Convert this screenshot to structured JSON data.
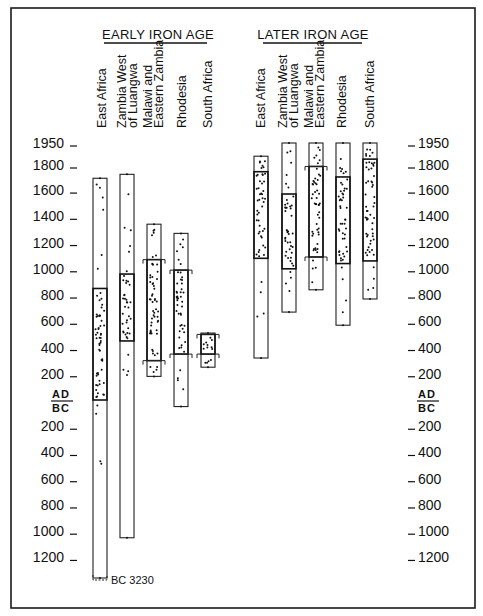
{
  "chart_data": {
    "type": "range-dot",
    "title": "",
    "groups": [
      {
        "title": "EARLY IRON AGE",
        "regions": [
          {
            "label": [
              "East Africa"
            ],
            "range": [
              -3230,
              1690
            ],
            "main_range": [
              0,
              850
            ],
            "bracketed": false,
            "note": "BC 3230"
          },
          {
            "label": [
              "Zambia West",
              "of Luangwa"
            ],
            "range": [
              -1050,
              1720
            ],
            "main_range": [
              450,
              960
            ],
            "bracketed": false
          },
          {
            "label": [
              "Malawi and",
              "Eastern Zambia"
            ],
            "range": [
              180,
              1340
            ],
            "main_range": [
              300,
              1070
            ],
            "bracketed": true
          },
          {
            "label": [
              "Rhodesia"
            ],
            "range": [
              -50,
              1270
            ],
            "main_range": [
              350,
              990
            ],
            "bracketed": true
          },
          {
            "label": [
              "South Africa"
            ],
            "range": [
              250,
              510
            ],
            "main_range": [
              350,
              500
            ],
            "bracketed": true
          }
        ]
      },
      {
        "title": "LATER IRON AGE",
        "regions": [
          {
            "label": [
              "East Africa"
            ],
            "range": [
              320,
              1860
            ],
            "main_range": [
              1080,
              1740
            ],
            "bracketed": false
          },
          {
            "label": [
              "Zambia West",
              "of Luangwa"
            ],
            "range": [
              670,
              1950
            ],
            "main_range": [
              1000,
              1570
            ],
            "bracketed": false
          },
          {
            "label": [
              "Malawi and",
              "Eastern Zambia"
            ],
            "range": [
              840,
              1950
            ],
            "main_range": [
              1090,
              1780
            ],
            "bracketed": true
          },
          {
            "label": [
              "Rhodesia"
            ],
            "range": [
              570,
              1950
            ],
            "main_range": [
              1040,
              1700
            ],
            "bracketed": false
          },
          {
            "label": [
              "South Africa"
            ],
            "range": [
              770,
              1950
            ],
            "main_range": [
              1060,
              1840
            ],
            "bracketed": false
          }
        ]
      }
    ],
    "axis": {
      "ad_ticks": [
        "1950",
        "1800",
        "1600",
        "1400",
        "1200",
        "1000",
        "800",
        "600",
        "400",
        "200"
      ],
      "divider": {
        "top": "AD",
        "bottom": "BC"
      },
      "bc_ticks": [
        "200",
        "400",
        "600",
        "800",
        "1000",
        "1200"
      ],
      "ylabel": "Date (years AD / BC)"
    },
    "legend": null,
    "grid": false
  },
  "labels": {
    "early_title": "EARLY IRON AGE",
    "later_title": "LATER IRON AGE",
    "ad": "AD",
    "bc": "BC",
    "bc_note": "BC 3230",
    "col": {
      "east_africa": "East Africa",
      "zambia_1": "Zambia West",
      "zambia_2": "of Luangwa",
      "malawi_1": "Malawi and",
      "malawi_2": "Eastern Zambia",
      "rhodesia": "Rhodesia",
      "south_africa": "South Africa"
    },
    "ticks": {
      "t1950": "1950",
      "t1800": "1800",
      "t1600": "1600",
      "t1400": "1400",
      "t1200": "1200",
      "t1000": "1000",
      "t800": "800",
      "t600": "600",
      "t400": "400",
      "t200": "200"
    }
  }
}
